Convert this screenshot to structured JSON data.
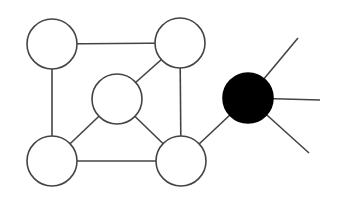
{
  "diagram": {
    "type": "graph",
    "colors": {
      "background": "#ffffff",
      "stroke": "#444444",
      "hollow_fill": "#ffffff",
      "filled_node": "#000000"
    },
    "nodes": [
      {
        "id": "top-left",
        "cx": 52,
        "cy": 44,
        "r": 25,
        "filled": false
      },
      {
        "id": "top-right",
        "cx": 180,
        "cy": 43,
        "r": 25,
        "filled": false
      },
      {
        "id": "center",
        "cx": 117,
        "cy": 99,
        "r": 25,
        "filled": false
      },
      {
        "id": "bottom-left",
        "cx": 52,
        "cy": 161,
        "r": 25,
        "filled": false
      },
      {
        "id": "bottom-right",
        "cx": 181,
        "cy": 161,
        "r": 25,
        "filled": false
      },
      {
        "id": "hub",
        "cx": 248,
        "cy": 98,
        "r": 25,
        "filled": true
      }
    ],
    "edges": [
      {
        "from": "top-left",
        "to": "top-right"
      },
      {
        "from": "top-left",
        "to": "bottom-left"
      },
      {
        "from": "top-right",
        "to": "bottom-right"
      },
      {
        "from": "bottom-left",
        "to": "bottom-right"
      },
      {
        "from": "center",
        "to": "top-right"
      },
      {
        "from": "center",
        "to": "bottom-left"
      },
      {
        "from": "center",
        "to": "bottom-right"
      },
      {
        "from": "bottom-right",
        "to": "hub"
      }
    ],
    "dangling_edges": [
      {
        "from": "hub",
        "x2": 298,
        "y2": 38
      },
      {
        "from": "hub",
        "x2": 320,
        "y2": 100
      },
      {
        "from": "hub",
        "x2": 309,
        "y2": 153
      }
    ]
  }
}
